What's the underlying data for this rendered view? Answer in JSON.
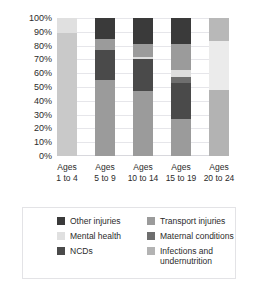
{
  "chart_data": {
    "type": "bar",
    "subtype": "stacked-bar-100-percent",
    "title": "",
    "xlabel": "",
    "ylabel": "",
    "ylim": [
      0,
      100
    ],
    "yticks": [
      "0%",
      "10%",
      "20%",
      "30%",
      "40%",
      "50%",
      "60%",
      "70%",
      "80%",
      "90%",
      "100%"
    ],
    "ytick_values": [
      0,
      10,
      20,
      30,
      40,
      50,
      60,
      70,
      80,
      90,
      100
    ],
    "grid": true,
    "legend_position": "bottom",
    "categories": [
      "Ages 1 to 4",
      "Ages 5 to 9",
      "Ages 10 to 14",
      "Ages 15 to 19",
      "Ages 20 to 24"
    ],
    "category_lines": [
      [
        "Ages",
        "1 to 4"
      ],
      [
        "Ages",
        "5 to 9"
      ],
      [
        "Ages",
        "10 to 14"
      ],
      [
        "Ages",
        "15 to 19"
      ],
      [
        "Ages",
        "20 to 24"
      ]
    ],
    "series": [
      {
        "name": "Infections and undernutrition",
        "color": "#c9c9c9",
        "values": [
          89,
          55,
          47,
          27,
          48
        ]
      },
      {
        "name": "NCDs",
        "color": "#4a4a4a",
        "values": [
          0,
          22,
          23,
          26,
          0
        ]
      },
      {
        "name": "Maternal conditions",
        "color": "#6e6e6e",
        "values": [
          0,
          0,
          0,
          4,
          0
        ]
      },
      {
        "name": "Mental health",
        "color": "#e0e0e0",
        "values": [
          11,
          0,
          2,
          5,
          35
        ]
      },
      {
        "name": "Transport injuries",
        "color": "#9b9b9b",
        "values": [
          0,
          8,
          9,
          19,
          17
        ]
      },
      {
        "name": "Other injuries",
        "color": "#3a3a3a",
        "values": [
          0,
          15,
          19,
          19,
          0
        ]
      }
    ],
    "stacks": [
      {
        "category": "Ages 1 to 4",
        "segments": [
          {
            "name": "Infections and undernutrition",
            "value": 89,
            "color": "#c9c9c9"
          },
          {
            "name": "Mental health",
            "value": 11,
            "color": "#e0e0e0"
          }
        ]
      },
      {
        "category": "Ages 5 to 9",
        "segments": [
          {
            "name": "Infections and undernutrition",
            "value": 55,
            "color": "#9b9b9b"
          },
          {
            "name": "NCDs",
            "value": 22,
            "color": "#4a4a4a"
          },
          {
            "name": "Transport injuries",
            "value": 8,
            "color": "#9b9b9b"
          },
          {
            "name": "Other injuries",
            "value": 15,
            "color": "#3a3a3a"
          }
        ]
      },
      {
        "category": "Ages 10 to 14",
        "segments": [
          {
            "name": "Infections and undernutrition",
            "value": 47,
            "color": "#9b9b9b"
          },
          {
            "name": "NCDs",
            "value": 23,
            "color": "#4a4a4a"
          },
          {
            "name": "Mental health",
            "value": 2,
            "color": "#dddddd"
          },
          {
            "name": "Transport injuries",
            "value": 9,
            "color": "#9b9b9b"
          },
          {
            "name": "Other injuries",
            "value": 19,
            "color": "#3a3a3a"
          }
        ]
      },
      {
        "category": "Ages 15 to 19",
        "segments": [
          {
            "name": "Infections and undernutrition",
            "value": 27,
            "color": "#9b9b9b"
          },
          {
            "name": "NCDs",
            "value": 26,
            "color": "#4a4a4a"
          },
          {
            "name": "Maternal conditions",
            "value": 4,
            "color": "#6e6e6e"
          },
          {
            "name": "Mental health",
            "value": 5,
            "color": "#dddddd"
          },
          {
            "name": "Transport injuries",
            "value": 19,
            "color": "#9b9b9b"
          },
          {
            "name": "Other injuries",
            "value": 19,
            "color": "#3a3a3a"
          }
        ]
      },
      {
        "category": "Ages 20 to 24",
        "segments": [
          {
            "name": "Infections and undernutrition",
            "value": 48,
            "color": "#b3b3b3"
          },
          {
            "name": "Mental health",
            "value": 35,
            "color": "#ebebeb"
          },
          {
            "name": "Transport injuries",
            "value": 17,
            "color": "#b8b8b8"
          }
        ]
      }
    ]
  },
  "legend": {
    "items": [
      {
        "label": "Other injuries",
        "color": "#3a3a3a"
      },
      {
        "label": "Transport injuries",
        "color": "#9b9b9b"
      },
      {
        "label": "Mental health",
        "color": "#e0e0e0"
      },
      {
        "label": "Maternal conditions",
        "color": "#6e6e6e"
      },
      {
        "label": "NCDs",
        "color": "#4a4a4a"
      },
      {
        "label": "Infections and undernutrition",
        "color": "#b3b3b3"
      }
    ]
  }
}
